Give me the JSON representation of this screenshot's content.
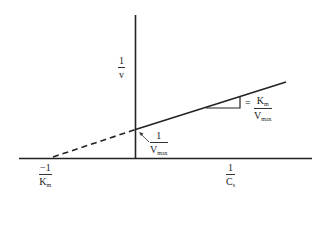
{
  "diagram": {
    "type": "Lineweaver-Burk double-reciprocal plot",
    "y_axis_label": {
      "numerator": "1",
      "denominator": "v"
    },
    "x_axis_label": {
      "numerator": "1",
      "denominator_main": "C",
      "denominator_sub": "s"
    },
    "x_intercept_label": {
      "numerator": "−1",
      "denominator_main": "K",
      "denominator_sub": "m"
    },
    "y_intercept_label": {
      "numerator": "1",
      "denominator_main": "V",
      "denominator_sub": "max"
    },
    "slope_label": {
      "prefix": "=",
      "numerator_main": "K",
      "numerator_sub": "m",
      "denominator_main": "V",
      "denominator_sub": "max"
    },
    "colors": {
      "line": "#222222",
      "background": "#ffffff"
    }
  }
}
